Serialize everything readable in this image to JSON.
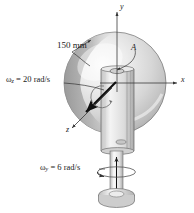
{
  "figure": {
    "type": "engineering-mechanics-diagram",
    "background_color": "#ffffff",
    "dimension_label": "150 mm",
    "point_label": "A",
    "axes": {
      "y_label": "y",
      "x_label": "x",
      "z_label": "z"
    },
    "angular_velocities": [
      {
        "name": "omega-z",
        "symbol": "ω",
        "subscript": "z",
        "equals": "=",
        "value": "20",
        "units": "rad/s",
        "full_text": "ωz = 20 rad/s"
      },
      {
        "name": "omega-y",
        "symbol": "ω",
        "subscript": "y",
        "equals": "=",
        "value": "6",
        "units": "rad/s",
        "full_text": "ωy = 6 rad/s"
      }
    ],
    "colors": {
      "disc_light": "#f2f2f2",
      "disc_mid": "#cfcfcf",
      "disc_dark": "#9a9a9a",
      "outline": "#4d4d4d",
      "arrow": "#111111",
      "shaft": "#e8e8e8",
      "bracket": "#dedede"
    }
  }
}
